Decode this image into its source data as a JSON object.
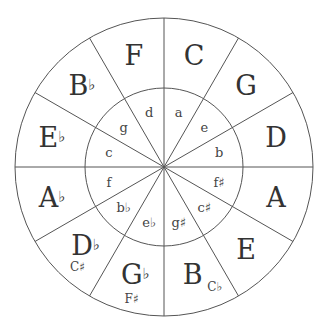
{
  "diagram": {
    "colors": {
      "line": "#555555",
      "text": "#333333",
      "background": "#ffffff"
    },
    "major_keys": [
      {
        "label": "C",
        "accidental": ""
      },
      {
        "label": "G",
        "accidental": ""
      },
      {
        "label": "D",
        "accidental": ""
      },
      {
        "label": "A",
        "accidental": ""
      },
      {
        "label": "E",
        "accidental": ""
      },
      {
        "label": "B",
        "accidental": "",
        "enharmonic": "C♭"
      },
      {
        "label": "G",
        "accidental": "♭",
        "enharmonic": "F♯"
      },
      {
        "label": "D",
        "accidental": "♭",
        "enharmonic": "C♯"
      },
      {
        "label": "A",
        "accidental": "♭"
      },
      {
        "label": "E",
        "accidental": "♭"
      },
      {
        "label": "B",
        "accidental": "♭"
      },
      {
        "label": "F",
        "accidental": ""
      }
    ],
    "minor_keys": [
      "a",
      "e",
      "b",
      "f♯",
      "c♯",
      "g♯",
      "e♭",
      "b♭",
      "f",
      "c",
      "g",
      "d"
    ]
  }
}
